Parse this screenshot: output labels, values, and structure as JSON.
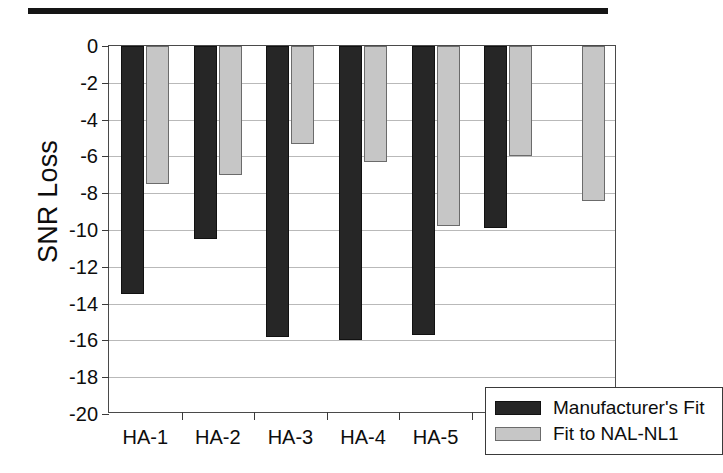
{
  "figure": {
    "scan_band_name": "top-scan-band"
  },
  "chart_data": {
    "type": "bar",
    "title": "",
    "subtitle": "",
    "xlabel": "",
    "ylabel": "SNR Loss",
    "categories": [
      "HA-1",
      "HA-2",
      "HA-3",
      "HA-4",
      "HA-5",
      "HA-6",
      "OLD"
    ],
    "series": [
      {
        "name": "Manufacturer's Fit",
        "color": "#262626",
        "values": [
          -13.5,
          -10.5,
          -15.8,
          -16.0,
          -15.7,
          -9.9,
          null
        ]
      },
      {
        "name": "Fit to NAL-NL1",
        "color": "#c6c6c6",
        "values": [
          -7.5,
          -7.0,
          -5.3,
          -6.3,
          -9.8,
          -6.0,
          -8.4
        ]
      }
    ],
    "ylim": [
      -20,
      0
    ],
    "ytick_values": [
      0,
      -2,
      -4,
      -6,
      -8,
      -10,
      -12,
      -14,
      -16,
      -18,
      -20
    ],
    "ytick_labels": [
      "0",
      "-2",
      "-4",
      "-6",
      "-8",
      "-10",
      "-12",
      "-14",
      "-16",
      "-18",
      "-20"
    ],
    "grid": true,
    "grid_axis": "y",
    "legend_position": "inside-bottom-right",
    "legend_entries": [
      "Manufacturer's Fit",
      "Fit to NAL-NL1"
    ]
  }
}
